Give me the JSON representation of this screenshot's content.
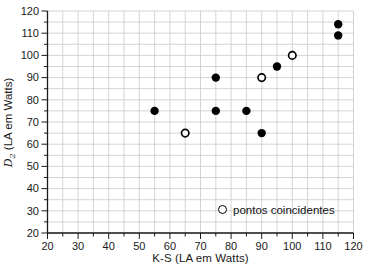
{
  "chart_data": {
    "type": "scatter",
    "title": "",
    "xlabel": "K-S (LA em Watts)",
    "ylabel": "D2 (LA em Watts)",
    "ylabel_parts": {
      "var": "D",
      "sub": "2",
      "rest": " (LA em Watts)"
    },
    "xlim": [
      20,
      120
    ],
    "ylim": [
      20,
      120
    ],
    "x_ticks": [
      20,
      30,
      40,
      50,
      60,
      70,
      80,
      90,
      100,
      110,
      120
    ],
    "y_ticks": [
      20,
      30,
      40,
      50,
      60,
      70,
      80,
      90,
      100,
      110,
      120
    ],
    "minor_tick_step": 5,
    "grid": true,
    "grid_step": 5,
    "legend_position": "inside-bottom-right",
    "series": [
      {
        "name": "",
        "marker": "filled-circle",
        "color": "#000000",
        "points": [
          [
            55,
            75
          ],
          [
            75,
            75
          ],
          [
            75,
            90
          ],
          [
            85,
            75
          ],
          [
            90,
            65
          ],
          [
            95,
            95
          ],
          [
            115,
            109
          ],
          [
            115,
            114
          ]
        ]
      },
      {
        "name": "pontos coincidentes",
        "marker": "open-circle",
        "color": "#000000",
        "points": [
          [
            65,
            65
          ],
          [
            90,
            90
          ],
          [
            100,
            100
          ]
        ]
      }
    ],
    "legend": {
      "marker": "open-circle",
      "label": "pontos coincidentes"
    }
  },
  "colors": {
    "background": "#ffffff",
    "grid": "#c9c9c9",
    "axis": "#1a1a1a",
    "text": "#1a1a1a",
    "point": "#000000"
  }
}
